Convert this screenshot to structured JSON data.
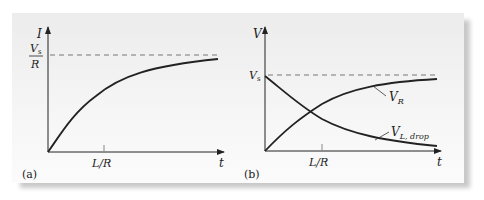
{
  "panels": [
    {
      "id": "a",
      "caption": "(a)",
      "y_axis_label": "I",
      "x_axis_label": "t",
      "asymptote_label_num": "V",
      "asymptote_label_num_sub": "s",
      "asymptote_label_den": "R",
      "tick_label": "L/R",
      "curves": [
        {
          "name": "I(t)",
          "shape": "rising exponential to Vs/R"
        }
      ]
    },
    {
      "id": "b",
      "caption": "(b)",
      "y_axis_label": "V",
      "x_axis_label": "t",
      "asymptote_label": "V",
      "asymptote_label_sub": "s",
      "tick_label": "L/R",
      "curves": [
        {
          "name": "V_R",
          "label": "V",
          "label_sub": "R",
          "shape": "rising exponential to Vs"
        },
        {
          "name": "V_L,drop",
          "label": "V",
          "label_sub": "L, drop",
          "shape": "decaying exponential from Vs"
        }
      ]
    }
  ],
  "colors": {
    "curve": "#222222",
    "dashed": "#777777",
    "panel_bg": "#f2f2f2"
  }
}
